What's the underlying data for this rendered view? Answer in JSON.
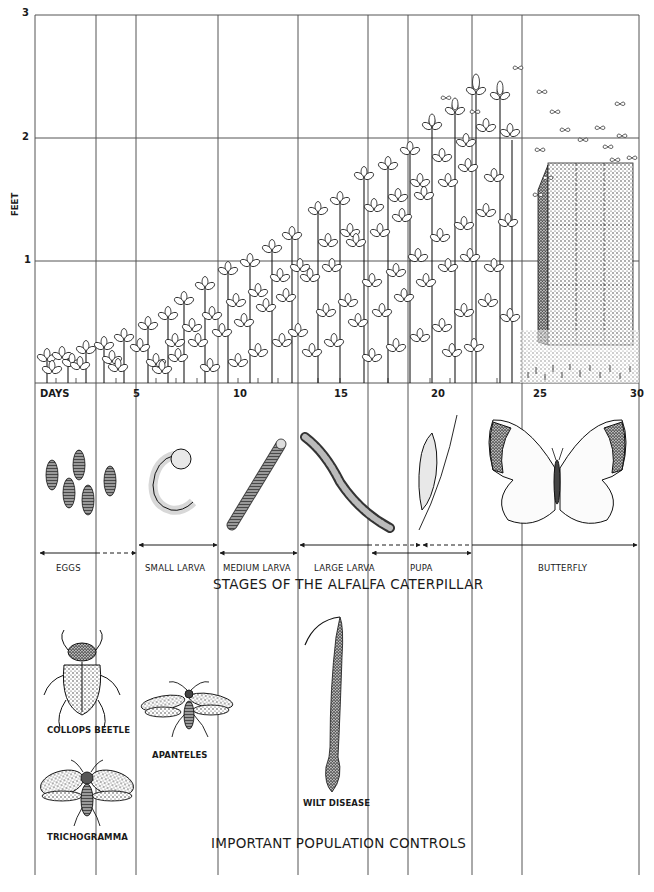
{
  "figure": {
    "y_axis": {
      "label": "FEET",
      "ticks": [
        "1",
        "2",
        "3"
      ]
    },
    "x_axis": {
      "label": "DAYS",
      "ticks": [
        "5",
        "10",
        "15",
        "20",
        "25",
        "30"
      ]
    },
    "top_illustration": "alfalfa plants growing from seedlings to ~2.5 ft over ~24 days, then cut and baled (hay stack) with butterflies swarming",
    "stages": {
      "title": "STAGES OF THE ALFALFA CATERPILLAR",
      "items": [
        {
          "label": "EGGS",
          "icon": "eggs-icon",
          "start_day": 0,
          "end_day": 5
        },
        {
          "label": "SMALL LARVA",
          "icon": "small-larva-icon",
          "start_day": 5,
          "end_day": 9
        },
        {
          "label": "MEDIUM LARVA",
          "icon": "medium-larva-icon",
          "start_day": 9,
          "end_day": 13
        },
        {
          "label": "LARGE LARVA",
          "icon": "large-larva-icon",
          "start_day": 13,
          "end_day": 19
        },
        {
          "label": "PUPA",
          "icon": "pupa-icon",
          "start_day": 17,
          "end_day": 22
        },
        {
          "label": "BUTTERFLY",
          "icon": "butterfly-icon",
          "start_day": 19,
          "end_day": 30
        }
      ]
    },
    "controls": {
      "title": "IMPORTANT POPULATION CONTROLS",
      "items": [
        {
          "label": "COLLOPS BEETLE",
          "icon": "collops-beetle-icon"
        },
        {
          "label": "APANTELES",
          "icon": "apanteles-wasp-icon"
        },
        {
          "label": "WILT DISEASE",
          "icon": "wilt-diseased-larva-icon"
        },
        {
          "label": "TRICHOGRAMMA",
          "icon": "trichogramma-wasp-icon"
        }
      ]
    },
    "colors": {
      "ink": "#1a1a1a",
      "grid": "#555555",
      "paper": "#ffffff"
    }
  }
}
